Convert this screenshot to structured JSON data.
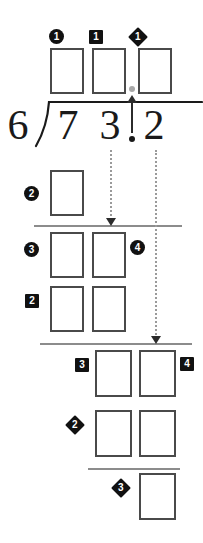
{
  "worksheet": {
    "title": "Long division with decimals worksheet",
    "operation": "division",
    "divisor": "6",
    "dividend": "73.2",
    "dividend_digits": [
      "7",
      "3",
      "2"
    ],
    "decimal_point": ".",
    "colors": {
      "box_border": "#4a4a4a",
      "rule": "#8c8c8c",
      "dotted_line": "#9a9a9a",
      "marker_fill": "#111111",
      "marker_text": "#ffffff",
      "digit": "#1a1a1a",
      "decimal_ghost": "#a8a8a8",
      "background": "#ffffff"
    }
  },
  "markers": {
    "quotient_ones": "1",
    "quotient_tens": "1",
    "quotient_decimal": "1",
    "step_two_circle": "2",
    "step_three_circle": "3",
    "step_four_circle": "4",
    "step_two_square": "2",
    "step_three_square": "3",
    "step_four_square": "4",
    "step_two_diamond": "2",
    "step_three_diamond": "3"
  },
  "answer_boxes": {
    "quotient": [
      "",
      "",
      ""
    ],
    "first_product": [
      ""
    ],
    "first_remainder": [
      "",
      ""
    ],
    "second_product": [
      "",
      ""
    ],
    "second_remainder": [
      "",
      ""
    ],
    "third_product": [
      "",
      ""
    ],
    "final_remainder": [
      ""
    ]
  }
}
